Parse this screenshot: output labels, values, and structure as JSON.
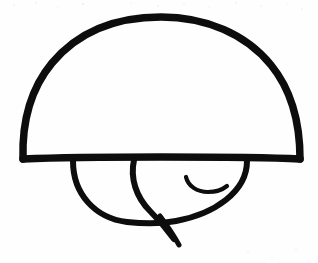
{
  "document": {
    "kind": "hand-drawn-ink-sketch",
    "title": "Mushroom-like dome sketch",
    "caption": "",
    "background_color": "#fefefe",
    "ink_color": "#0d0d0d",
    "speckle_color": "#e9e9ee",
    "width": 318,
    "height": 263
  },
  "drawing": {
    "description": "A large semicircular dome cap resting on a flat horizontal baseline, with a partial circle below it containing an inner diagonal curve, a small hook stroke, and a short tail crossing below the circle.",
    "strokes": [
      {
        "name": "dome-cap",
        "label": "Dome cap outline",
        "stroke_width": 7.5,
        "path": "M 23 159 C 22 126 28 92 52 63 C 78 32 116 17 161 17 C 206 17 246 34 271 65 C 293 92 300 126 300 159"
      },
      {
        "name": "dome-baseline",
        "label": "Flat baseline under dome",
        "stroke_width": 7.5,
        "path": "M 23 159 C 70 157 120 157 161 157 C 205 157 260 157 300 159"
      },
      {
        "name": "lower-circle-arc",
        "label": "Lower partial circle",
        "stroke_width": 6.0,
        "path": "M 73 161 C 73 194 95 218 127 222 C 145 224 161 224 176 221 C 214 214 247 192 247 161"
      },
      {
        "name": "inner-diagonal-curve",
        "label": "Inner curve from baseline to tail",
        "stroke_width": 6.0,
        "path": "M 134 160 C 130 178 136 197 150 211 C 158 219 166 228 174 239"
      },
      {
        "name": "tail-stroke",
        "label": "Tail crossing below circle",
        "stroke_width": 5.0,
        "path": "M 160 216 C 166 224 173 234 179 245"
      },
      {
        "name": "hook-stroke",
        "label": "Small hook curl",
        "stroke_width": 4.2,
        "path": "M 186 177 C 188 186 197 192 208 192 C 216 192 222 190 227 186"
      }
    ],
    "specks": [
      {
        "x": 14,
        "y": 5,
        "r": 0.8
      },
      {
        "x": 36,
        "y": 3,
        "r": 0.7
      },
      {
        "x": 58,
        "y": 7,
        "r": 0.6
      },
      {
        "x": 83,
        "y": 4,
        "r": 0.9
      },
      {
        "x": 104,
        "y": 8,
        "r": 0.7
      },
      {
        "x": 131,
        "y": 3,
        "r": 0.6
      },
      {
        "x": 158,
        "y": 6,
        "r": 0.8
      },
      {
        "x": 184,
        "y": 4,
        "r": 0.7
      },
      {
        "x": 209,
        "y": 7,
        "r": 0.6
      },
      {
        "x": 236,
        "y": 3,
        "r": 0.8
      },
      {
        "x": 261,
        "y": 6,
        "r": 0.7
      },
      {
        "x": 287,
        "y": 4,
        "r": 0.6
      },
      {
        "x": 302,
        "y": 9,
        "r": 0.7
      },
      {
        "x": 248,
        "y": 252,
        "r": 0.7
      },
      {
        "x": 272,
        "y": 257,
        "r": 0.6
      },
      {
        "x": 296,
        "y": 250,
        "r": 0.7
      }
    ]
  }
}
